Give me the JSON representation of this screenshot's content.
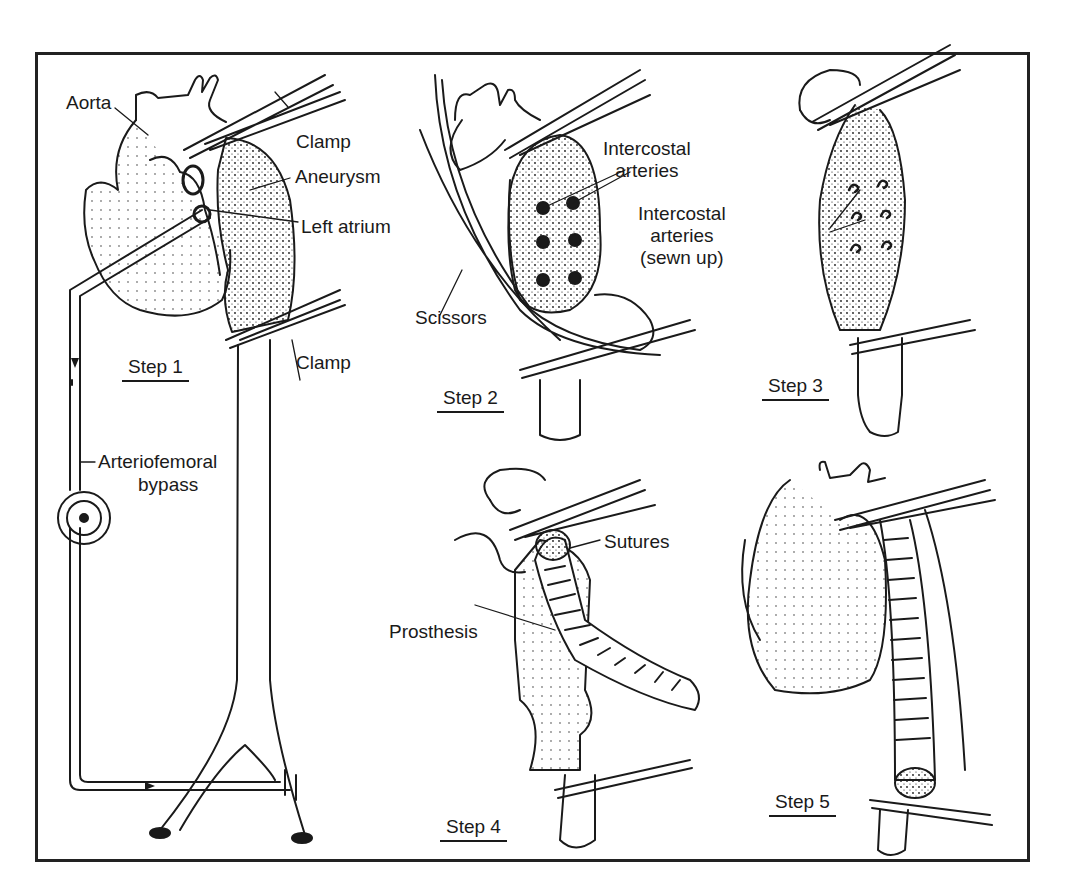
{
  "figure": {
    "colors": {
      "ink": "#1a1a1a",
      "background": "#ffffff",
      "frame": "#222222"
    }
  },
  "labels": {
    "aorta": "Aorta",
    "clamp_top": "Clamp",
    "aneurysm": "Aneurysm",
    "left_atrium": "Left atrium",
    "clamp_bottom": "Clamp",
    "bypass_line1": "Arteriofemoral",
    "bypass_line2": "bypass",
    "intercostal_line1": "Intercostal",
    "intercostal_line2": "arteries",
    "scissors": "Scissors",
    "intercostal_sewn_line1": "Intercostal",
    "intercostal_sewn_line2": "arteries",
    "intercostal_sewn_line3": "(sewn up)",
    "sutures": "Sutures",
    "prosthesis": "Prosthesis"
  },
  "steps": [
    {
      "label": "Step 1"
    },
    {
      "label": "Step 2"
    },
    {
      "label": "Step 3"
    },
    {
      "label": "Step 4"
    },
    {
      "label": "Step 5"
    }
  ]
}
